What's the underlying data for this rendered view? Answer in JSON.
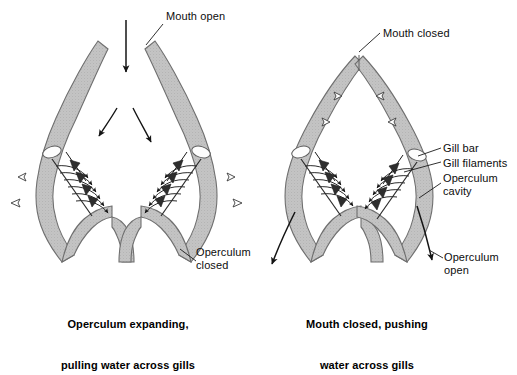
{
  "figure": {
    "background_color": "#ffffff",
    "tissue_fill": "#c0c0c0",
    "tissue_stroke": "#6b6b6b",
    "ink_color": "#111111"
  },
  "panels": [
    {
      "id": "left",
      "phase_labels": {
        "mouth": "Mouth open",
        "operculum": "Operculum\nclosed"
      },
      "caption_line1": "Operculum expanding,",
      "caption_line2": "pulling water across gills"
    },
    {
      "id": "right",
      "phase_labels": {
        "mouth": "Mouth closed",
        "operculum": "Operculum\nopen"
      },
      "anatomy_labels": {
        "gill_bar": "Gill bar",
        "gill_filaments": "Gill filaments",
        "operculum_cavity": "Operculum\ncavity"
      },
      "caption_line1": "Mouth closed, pushing",
      "caption_line2": "water across gills"
    }
  ],
  "annotations": {
    "mouth_open": "Mouth open",
    "mouth_closed": "Mouth closed",
    "operculum_closed": "Operculum\nclosed",
    "operculum_open": "Operculum\nopen",
    "gill_bar": "Gill bar",
    "gill_filaments": "Gill filaments",
    "operculum_cavity": "Operculum\ncavity"
  },
  "captions": {
    "left_line1": "Operculum expanding,",
    "left_line2": "pulling water across gills",
    "right_line1": "Mouth closed, pushing",
    "right_line2": "water across gills"
  }
}
